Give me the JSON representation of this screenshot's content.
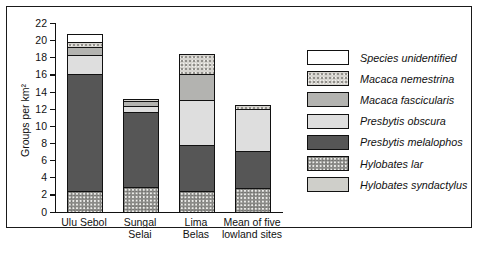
{
  "chart_data": {
    "type": "bar",
    "stacked": true,
    "title": "",
    "xlabel": "",
    "ylabel": "Groups per km²",
    "ylim": [
      0,
      22
    ],
    "ytick_step": 2,
    "yticks": [
      0,
      2,
      4,
      6,
      8,
      10,
      12,
      14,
      16,
      18,
      20,
      22
    ],
    "grid": false,
    "legend_position": "right",
    "categories": [
      "Ulu Sebol",
      "Sungal\nSelai",
      "Lima\nBelas",
      "Mean of five\nlowland sites"
    ],
    "series": [
      {
        "name": "Hylobates lar",
        "fill": "f-speckle-dark",
        "values": [
          2.3,
          2.8,
          2.3,
          2.7
        ]
      },
      {
        "name": "Presbytis melalophos",
        "fill": "f-darkgray",
        "values": [
          13.7,
          8.8,
          5.4,
          4.3
        ]
      },
      {
        "name": "Presbytis obscura",
        "fill": "f-lightgray",
        "values": [
          2.2,
          0.6,
          5.2,
          4.9
        ]
      },
      {
        "name": "Macaca fascicularis",
        "fill": "f-midgray",
        "values": [
          0.9,
          0.6,
          3.1,
          0.0
        ]
      },
      {
        "name": "Macaca nemestrina",
        "fill": "f-speckle-light",
        "values": [
          0.6,
          0.3,
          2.3,
          0.5
        ]
      },
      {
        "name": "Hylobates syndactylus",
        "fill": "f-palegray",
        "values": [
          0.0,
          0.0,
          0.0,
          0.0
        ]
      },
      {
        "name": "Species unidentified",
        "fill": "f-white",
        "values": [
          0.9,
          0.0,
          0.0,
          0.0
        ]
      }
    ],
    "totals": [
      20.6,
      13.1,
      18.3,
      12.4
    ]
  },
  "legend": {
    "items": [
      {
        "label": "Species unidentified",
        "fill": "f-white"
      },
      {
        "label": "Macaca nemestrina",
        "fill": "f-speckle-light"
      },
      {
        "label": "Macaca fascicularis",
        "fill": "f-midgray"
      },
      {
        "label": "Presbytis obscura",
        "fill": "f-lightgray"
      },
      {
        "label": "Presbytis melalophos",
        "fill": "f-darkgray"
      },
      {
        "label": "Hylobates lar",
        "fill": "f-speckle-dark"
      },
      {
        "label": "Hylobates syndactylus",
        "fill": "f-palegray"
      }
    ]
  }
}
